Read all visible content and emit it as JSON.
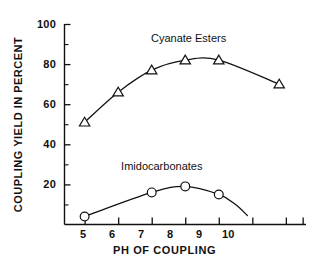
{
  "chart_data": {
    "type": "line",
    "title": "",
    "xlabel": "PH OF COUPLING",
    "ylabel": "COUPLING YIELD IN PERCENT",
    "xlim": [
      4.4,
      11.6
    ],
    "ylim": [
      0,
      100
    ],
    "grid": false,
    "legend_position": "inline-annotations",
    "x_ticks_major": [
      5,
      6,
      7,
      8,
      9,
      10
    ],
    "x_tick_labels": [
      "5",
      "6",
      "7",
      "8",
      "9",
      "10"
    ],
    "x_ticks_unlabeled": [
      11,
      11.5
    ],
    "y_ticks_major": [
      20,
      40,
      60,
      80,
      100
    ],
    "y_tick_labels": [
      "20",
      "40",
      "60",
      "80",
      "100"
    ],
    "y_ticks_minor": [
      10,
      30,
      50,
      70,
      90
    ],
    "series": [
      {
        "name": "Cyanate Esters",
        "marker": "triangle",
        "x": [
          5,
          6,
          7,
          8,
          9,
          10.8
        ],
        "values": [
          51,
          66,
          77,
          82,
          82,
          70
        ]
      },
      {
        "name": "Imidocarbonates",
        "marker": "circle",
        "x": [
          5,
          7,
          8,
          9
        ],
        "values": [
          4,
          16,
          19,
          15
        ]
      }
    ],
    "annotations": [
      {
        "text": "Cyanate Esters",
        "x": 8.1,
        "y": 93
      },
      {
        "text": "Imidocarbonates",
        "x": 7.3,
        "y": 29
      }
    ],
    "colors": {
      "line": "#111111",
      "marker_fill": "#ffffff",
      "axis": "#111111",
      "background": "#ffffff"
    }
  },
  "axes": {
    "y_labels": [
      {
        "text": "100",
        "top": 19,
        "right": 264
      },
      {
        "text": "80",
        "top": 59,
        "right": 264
      },
      {
        "text": "60",
        "top": 99,
        "right": 264
      },
      {
        "text": "40",
        "top": 139,
        "right": 264
      },
      {
        "text": "20",
        "top": 179,
        "right": 264
      }
    ],
    "x_labels": [
      {
        "text": "5",
        "left": 80,
        "top": 229
      },
      {
        "text": "6",
        "left": 109,
        "top": 229
      },
      {
        "text": "7",
        "left": 138,
        "top": 229
      },
      {
        "text": "8",
        "left": 167,
        "top": 229
      },
      {
        "text": "9",
        "left": 196,
        "top": 229
      },
      {
        "text": "10",
        "left": 222,
        "top": 229
      }
    ],
    "x_axis_title": "PH OF COUPLING",
    "y_axis_title": "COUPLING YIELD IN PERCENT"
  }
}
